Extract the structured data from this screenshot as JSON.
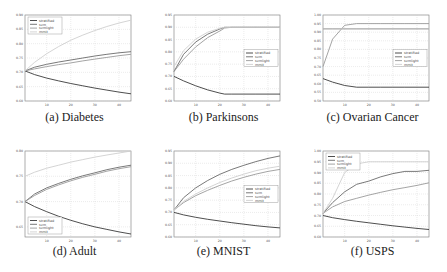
{
  "figure": {
    "captions": [
      "(a) Diabetes",
      "(b) Parkinsons",
      "(c) Ovarian Cancer",
      "(d) Adult",
      "(e) MNIST",
      "(f) USPS"
    ]
  },
  "legend_labels": [
    "stratified",
    "svm",
    "svmlight",
    "mmit"
  ],
  "colors": {
    "stratified": "#3a3a3a",
    "svm": "#6a6a6a",
    "svmlight": "#9a9a9a",
    "mmit": "#cfcfcf",
    "grid": "#d0d0d0",
    "axis": "#777777"
  },
  "chart_data": [
    {
      "type": "line",
      "title": "(a) Diabetes",
      "xlabel": "",
      "ylabel": "",
      "xlim": [
        1,
        45
      ],
      "ylim": [
        0.6,
        0.9
      ],
      "xticks": [
        10,
        20,
        30,
        40
      ],
      "yticks": [
        0.6,
        0.65,
        0.7,
        0.75,
        0.8,
        0.85,
        0.9
      ],
      "grid": true,
      "legend_position": "upper left",
      "x": [
        1,
        5,
        10,
        15,
        20,
        25,
        30,
        35,
        40,
        45
      ],
      "series": [
        {
          "name": "stratified",
          "values": [
            0.705,
            0.692,
            0.68,
            0.67,
            0.661,
            0.653,
            0.645,
            0.638,
            0.631,
            0.625
          ]
        },
        {
          "name": "svm",
          "values": [
            0.705,
            0.718,
            0.728,
            0.736,
            0.743,
            0.75,
            0.757,
            0.763,
            0.768,
            0.772
          ]
        },
        {
          "name": "svmlight",
          "values": [
            0.705,
            0.712,
            0.72,
            0.727,
            0.733,
            0.74,
            0.746,
            0.752,
            0.758,
            0.763
          ]
        },
        {
          "name": "mmit",
          "values": [
            0.705,
            0.735,
            0.765,
            0.79,
            0.812,
            0.83,
            0.846,
            0.86,
            0.872,
            0.882
          ]
        }
      ]
    },
    {
      "type": "line",
      "title": "(b) Parkinsons",
      "xlabel": "",
      "ylabel": "",
      "xlim": [
        1,
        45
      ],
      "ylim": [
        0.6,
        0.95
      ],
      "xticks": [
        10,
        20,
        30,
        40
      ],
      "yticks": [
        0.6,
        0.65,
        0.7,
        0.75,
        0.8,
        0.85,
        0.9,
        0.95
      ],
      "grid": true,
      "legend_position": "center right",
      "x": [
        1,
        5,
        10,
        15,
        20,
        22,
        25,
        30,
        35,
        40,
        45
      ],
      "series": [
        {
          "name": "stratified",
          "values": [
            0.7,
            0.682,
            0.662,
            0.645,
            0.632,
            0.628,
            0.628,
            0.628,
            0.628,
            0.628,
            0.628
          ]
        },
        {
          "name": "svm",
          "values": [
            0.72,
            0.79,
            0.84,
            0.872,
            0.893,
            0.9,
            0.9,
            0.9,
            0.9,
            0.9,
            0.9
          ]
        },
        {
          "name": "svmlight",
          "values": [
            0.72,
            0.77,
            0.82,
            0.858,
            0.885,
            0.897,
            0.9,
            0.9,
            0.9,
            0.9,
            0.9
          ]
        },
        {
          "name": "mmit",
          "values": [
            0.74,
            0.805,
            0.852,
            0.88,
            0.896,
            0.9,
            0.9,
            0.9,
            0.9,
            0.9,
            0.9
          ]
        }
      ]
    },
    {
      "type": "line",
      "title": "(c) Ovarian Cancer",
      "xlabel": "",
      "ylabel": "",
      "xlim": [
        1,
        45
      ],
      "ylim": [
        0.5,
        1.0
      ],
      "xticks": [
        10,
        20,
        30,
        40
      ],
      "yticks": [
        0.5,
        0.55,
        0.6,
        0.65,
        0.7,
        0.75,
        0.8,
        0.85,
        0.9,
        0.95,
        1.0
      ],
      "grid": true,
      "legend_position": "center right",
      "x": [
        1,
        5,
        10,
        15,
        20,
        25,
        30,
        35,
        40,
        45
      ],
      "series": [
        {
          "name": "stratified",
          "values": [
            0.63,
            0.61,
            0.59,
            0.58,
            0.58,
            0.58,
            0.58,
            0.58,
            0.58,
            0.58
          ]
        },
        {
          "name": "svm",
          "values": [
            0.92,
            0.92,
            0.92,
            0.92,
            0.92,
            0.92,
            0.92,
            0.92,
            0.92,
            0.92
          ]
        },
        {
          "name": "svmlight",
          "values": [
            0.7,
            0.86,
            0.94,
            0.95,
            0.95,
            0.95,
            0.95,
            0.95,
            0.95,
            0.95
          ]
        },
        {
          "name": "mmit",
          "values": [
            0.92,
            0.92,
            0.92,
            0.92,
            0.92,
            0.92,
            0.92,
            0.92,
            0.92,
            0.92
          ]
        }
      ]
    },
    {
      "type": "line",
      "title": "(d) Adult",
      "xlabel": "",
      "ylabel": "",
      "xlim": [
        1,
        45
      ],
      "ylim": [
        0.63,
        0.8
      ],
      "xticks": [
        10,
        20,
        30,
        40
      ],
      "yticks": [
        0.65,
        0.7,
        0.75,
        0.8
      ],
      "grid": true,
      "legend_position": "lower left",
      "x": [
        1,
        5,
        10,
        15,
        20,
        25,
        30,
        35,
        40,
        45
      ],
      "series": [
        {
          "name": "stratified",
          "values": [
            0.7,
            0.69,
            0.68,
            0.671,
            0.663,
            0.656,
            0.65,
            0.645,
            0.64,
            0.636
          ]
        },
        {
          "name": "svm",
          "values": [
            0.7,
            0.715,
            0.727,
            0.736,
            0.744,
            0.751,
            0.757,
            0.763,
            0.768,
            0.772
          ]
        },
        {
          "name": "svmlight",
          "values": [
            0.7,
            0.712,
            0.724,
            0.733,
            0.741,
            0.748,
            0.754,
            0.76,
            0.765,
            0.769
          ]
        },
        {
          "name": "mmit",
          "values": [
            0.75,
            0.758,
            0.766,
            0.772,
            0.778,
            0.783,
            0.788,
            0.792,
            0.796,
            0.8
          ]
        }
      ]
    },
    {
      "type": "line",
      "title": "(e) MNIST",
      "xlabel": "",
      "ylabel": "",
      "xlim": [
        1,
        45
      ],
      "ylim": [
        0.6,
        0.95
      ],
      "xticks": [
        10,
        20,
        30,
        40
      ],
      "yticks": [
        0.6,
        0.65,
        0.7,
        0.75,
        0.8,
        0.85,
        0.9,
        0.95
      ],
      "grid": true,
      "legend_position": "center right",
      "x": [
        1,
        5,
        10,
        15,
        20,
        25,
        30,
        35,
        40,
        45
      ],
      "series": [
        {
          "name": "stratified",
          "values": [
            0.7,
            0.69,
            0.68,
            0.672,
            0.665,
            0.658,
            0.652,
            0.646,
            0.641,
            0.637
          ]
        },
        {
          "name": "svm",
          "values": [
            0.71,
            0.76,
            0.8,
            0.83,
            0.855,
            0.875,
            0.892,
            0.907,
            0.92,
            0.93
          ]
        },
        {
          "name": "svmlight",
          "values": [
            0.71,
            0.74,
            0.768,
            0.79,
            0.81,
            0.828,
            0.843,
            0.856,
            0.867,
            0.875
          ]
        },
        {
          "name": "mmit",
          "values": [
            0.71,
            0.745,
            0.775,
            0.8,
            0.822,
            0.84,
            0.856,
            0.87,
            0.88,
            0.888
          ]
        }
      ]
    },
    {
      "type": "line",
      "title": "(f) USPS",
      "xlabel": "",
      "ylabel": "",
      "xlim": [
        1,
        45
      ],
      "ylim": [
        0.6,
        1.0
      ],
      "xticks": [
        10,
        20,
        30,
        40
      ],
      "yticks": [
        0.6,
        0.65,
        0.7,
        0.75,
        0.8,
        0.85,
        0.9,
        0.95,
        1.0
      ],
      "grid": true,
      "legend_position": "upper left",
      "x": [
        1,
        5,
        10,
        15,
        20,
        25,
        30,
        35,
        40,
        45
      ],
      "series": [
        {
          "name": "stratified",
          "values": [
            0.7,
            0.69,
            0.681,
            0.673,
            0.666,
            0.659,
            0.652,
            0.646,
            0.64,
            0.635
          ]
        },
        {
          "name": "svm",
          "values": [
            0.71,
            0.76,
            0.81,
            0.845,
            0.86,
            0.88,
            0.895,
            0.905,
            0.905,
            0.91
          ]
        },
        {
          "name": "svmlight",
          "values": [
            0.71,
            0.74,
            0.765,
            0.78,
            0.795,
            0.808,
            0.82,
            0.83,
            0.84,
            0.852
          ]
        },
        {
          "name": "mmit",
          "values": [
            0.71,
            0.78,
            0.9,
            0.94,
            0.95,
            0.95,
            0.95,
            0.95,
            0.95,
            0.95
          ]
        }
      ]
    }
  ]
}
